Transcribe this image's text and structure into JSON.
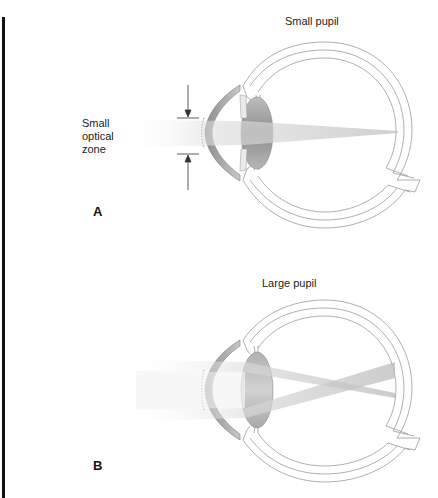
{
  "figure": {
    "panels": [
      {
        "id": "A",
        "letter": "A",
        "title": "Small pupil",
        "annotation": [
          "Small",
          "optical",
          "zone"
        ],
        "rays": "narrow converging beam focused to a single point on retina"
      },
      {
        "id": "B",
        "letter": "B",
        "title": "Large pupil",
        "rays": "two peripheral beams crossing before the retina"
      }
    ],
    "colors": {
      "outline": "#9a9a9a",
      "iris": "#8c8c8c",
      "lens": "#9e9e9e",
      "beam": "#d6d6d6",
      "left_bar": "#111111"
    }
  }
}
